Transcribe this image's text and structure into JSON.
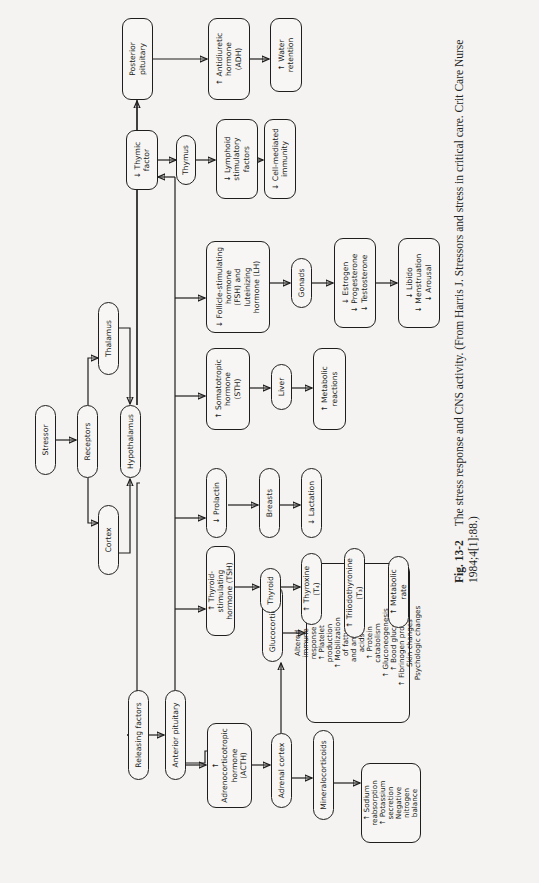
{
  "diagram": {
    "title": "The stress response and CNS activity",
    "nodes": {
      "stressor": "Stressor",
      "receptors": "Receptors",
      "cortex": "Cortex",
      "thalamus": "Thalamus",
      "hypothalamus": "Hypothalamus",
      "releasing_factors": "Releasing factors",
      "anterior_pituitary": "Anterior pituitary",
      "posterior_pituitary": "Posterior\npituitary",
      "adh": "↑ Antidiuretic\nhormone\n(ADH)",
      "water_retention": "↑ Water\nretention",
      "acth": "↑ Adrenocorticotropic\nhormone\n(ACTH)",
      "adrenal_cortex": "Adrenal cortex",
      "glucocorticoids": "Glucocorticoids",
      "mineralocorticoids": "Mineralocorticoids",
      "glucocorticoid_effects": "Altered\nimmune\nresponse\n↑ Platelet\nproduction\n↑ Mobilization\nof fatty\nand amino\nacids\n↑ Protein\ncatabolism\n↑ Gluconeogenesis\n↑ Bood glucose\n↑ Fibrinogen production\nSkin changes\nPsychologic changes",
      "mineralocorticoid_effects": "↑ Sodium\nreabsorption\n↑ Potassium\nsecretion\nNegative\nnitrogen\nbalance",
      "tsh": "↑ Thyroid-stimulating\nhormone (TSH)",
      "thyroid": "Thyroid",
      "thyroxine": "↑ Thyroxine (T₄)",
      "triiodothyronine": "↑ Triiodothyronine (T₃)",
      "metabolic_rate": "↑ Metabolic rate",
      "prolactin": "↓ Prolactin",
      "breasts": "Breasts",
      "lactation": "↓ Lactation",
      "sth": "↑ Somatotropic\nhormone\n(STH)",
      "liver": "Liver",
      "metabolic_reactions": "↑ Metabolic\nreactions",
      "fsh_lh": "↓ Follicle-stimulating\nhormone\n(FSH) and\nluteinizing\nhormone (LH)",
      "gonads": "Gonads",
      "sex_hormones": "↓ Estrogen\n↓ Progesterone\n↓ Testosterone",
      "sexual_effects": "↓ Libido\n↓ Menstruation\n↓ Arousal",
      "thymic_factor": "↓ Thymic\nfactor",
      "thymus": "Thymus",
      "lymphoid_factors": "↓ Lymphoid\nstimulatory\nfactors",
      "cell_mediated_immunity": "↓ Cell-mediated\nimmunity"
    },
    "caption": {
      "label": "Fig. 13-2",
      "text": "The stress response and CNS activity. (From Harris J. Stressors and stress in critical care. Crit Care Nurse 1984;4[1]:88.)"
    }
  }
}
